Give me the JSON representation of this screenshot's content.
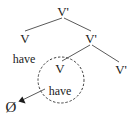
{
  "diagram": {
    "type": "syntax-tree",
    "title": "",
    "colors": {
      "line": "#5a5a5a",
      "text": "#1c1c1c",
      "circle_dash": "#3b3b3b",
      "background": "#ffffff"
    },
    "nodes": [
      {
        "id": "root",
        "label": "V'",
        "x": 63,
        "y": 11,
        "kind": "category"
      },
      {
        "id": "left-v",
        "label": "V",
        "x": 25,
        "y": 38,
        "kind": "category"
      },
      {
        "id": "mid-vbar",
        "label": "V'",
        "x": 91,
        "y": 38,
        "kind": "category"
      },
      {
        "id": "left-word",
        "label": "have",
        "x": 24,
        "y": 59,
        "kind": "word"
      },
      {
        "id": "trace-v",
        "label": "V",
        "x": 60,
        "y": 68,
        "kind": "category"
      },
      {
        "id": "trace-word",
        "label": "have",
        "x": 60,
        "y": 91,
        "kind": "word"
      },
      {
        "id": "right-vbar",
        "label": "V'",
        "x": 121,
        "y": 69,
        "kind": "category"
      },
      {
        "id": "null-elem",
        "label": "Ø",
        "x": 11,
        "y": 107,
        "kind": "null"
      }
    ],
    "branches": [
      {
        "from": "root",
        "to": "left-v",
        "x1": 62,
        "y1": 18,
        "x2": 25,
        "y2": 31
      },
      {
        "from": "root",
        "to": "mid-vbar",
        "x1": 64,
        "y1": 18,
        "x2": 91,
        "y2": 31
      },
      {
        "from": "mid-vbar",
        "to": "trace-v",
        "x1": 90,
        "y1": 45,
        "x2": 62,
        "y2": 61
      },
      {
        "from": "mid-vbar",
        "to": "right-vbar",
        "x1": 92,
        "y1": 45,
        "x2": 119,
        "y2": 62
      }
    ],
    "circle": {
      "label": "dotted-movement-circle",
      "cx": 61,
      "cy": 80,
      "r": 23,
      "dash": "1.6 2.6"
    },
    "arrow": {
      "label": "movement-arrow",
      "x1": 45,
      "y1": 89,
      "x2": 20,
      "y2": 101
    }
  }
}
